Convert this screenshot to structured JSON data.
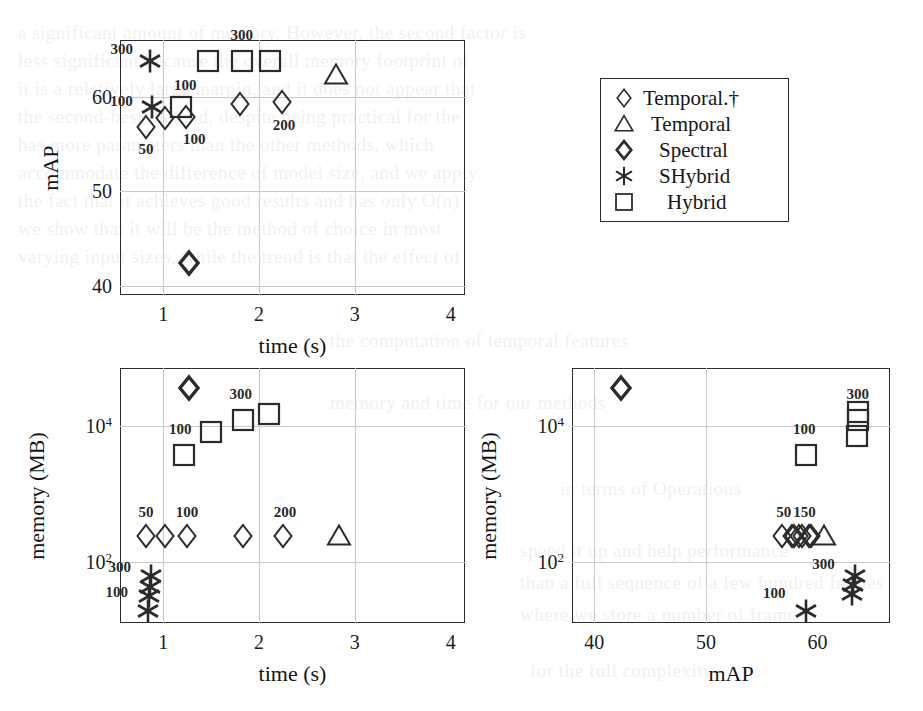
{
  "figure": {
    "background_color": "#ffffff",
    "marker_color": "#2b2b2b",
    "grid_color": "#c9c9c9",
    "axis_color": "#2b2b2b"
  },
  "legend": {
    "position": "top-right",
    "entries": [
      {
        "label": "Temporal.†",
        "marker": "diamond-thin"
      },
      {
        "label": "Temporal",
        "marker": "triangle"
      },
      {
        "label": "Spectral",
        "marker": "diamond-bold"
      },
      {
        "label": "SHybrid",
        "marker": "star"
      },
      {
        "label": "Hybrid",
        "marker": "square"
      }
    ]
  },
  "bleed_text": [
    {
      "text": "a significant amount of memory.  However, the second factor is",
      "x": 18,
      "y": 22,
      "size": 19
    },
    {
      "text": "less significant because the overall memory footprint of",
      "x": 18,
      "y": 50,
      "size": 19
    },
    {
      "text": "it is a relatively large margin, and it does not appear that",
      "x": 18,
      "y": 78,
      "size": 19
    },
    {
      "text": "the second-best method, despite being practical for the",
      "x": 18,
      "y": 106,
      "size": 19
    },
    {
      "text": "has more parameters than the other methods, which",
      "x": 18,
      "y": 134,
      "size": 19
    },
    {
      "text": "accommodate the difference of model size, and we apply",
      "x": 18,
      "y": 162,
      "size": 19
    },
    {
      "text": "the fact that it achieves good results and has only O(n)",
      "x": 18,
      "y": 190,
      "size": 19
    },
    {
      "text": "we show that it will be the method of choice in most",
      "x": 18,
      "y": 218,
      "size": 19
    },
    {
      "text": "varying input sizes, while the trend is that the effect of",
      "x": 18,
      "y": 246,
      "size": 19
    },
    {
      "text": "the computation of temporal features",
      "x": 330,
      "y": 330,
      "size": 19
    },
    {
      "text": "memory and time for our methods",
      "x": 330,
      "y": 392,
      "size": 19
    },
    {
      "text": "in terms of Operations",
      "x": 560,
      "y": 478,
      "size": 19
    },
    {
      "text": "speed it up and help performance",
      "x": 520,
      "y": 540,
      "size": 19
    },
    {
      "text": "than a full sequence of a few hundred frames",
      "x": 520,
      "y": 572,
      "size": 19
    },
    {
      "text": "where we store a number of frames",
      "x": 520,
      "y": 604,
      "size": 19
    },
    {
      "text": "for the full complexity",
      "x": 530,
      "y": 660,
      "size": 19
    }
  ],
  "chart_data": [
    {
      "id": "map-vs-time",
      "type": "scatter",
      "title": "",
      "xlabel": "time (s)",
      "ylabel": "mAP",
      "xlim": [
        0.55,
        4.15
      ],
      "ylim": [
        39.0,
        66.0
      ],
      "xticks": [
        "1",
        "2",
        "3",
        "4"
      ],
      "xtick_values": [
        1,
        2,
        3,
        4
      ],
      "yticks": [
        "60",
        "50",
        "40"
      ],
      "ytick_values": [
        60,
        50,
        40
      ],
      "grid": true,
      "series": [
        {
          "name": "Temporal.†",
          "marker": "diamond-thin",
          "points": [
            {
              "x": 0.82,
              "y": 56.8,
              "label": "50",
              "label_dx": 0,
              "label_dy": 22
            },
            {
              "x": 1.02,
              "y": 57.7,
              "label": null,
              "label_dx": 0,
              "label_dy": 0
            },
            {
              "x": 1.24,
              "y": 57.9,
              "label": "100",
              "label_dx": 8,
              "label_dy": 22
            },
            {
              "x": 1.8,
              "y": 59.2,
              "label": null,
              "label_dx": 0,
              "label_dy": 0
            },
            {
              "x": 2.24,
              "y": 59.4,
              "label": "200",
              "label_dx": 2,
              "label_dy": 23
            }
          ]
        },
        {
          "name": "Temporal",
          "marker": "triangle",
          "points": [
            {
              "x": 2.8,
              "y": 62.3,
              "label": null,
              "label_dx": 0,
              "label_dy": 0
            }
          ]
        },
        {
          "name": "Spectral",
          "marker": "diamond-bold",
          "points": [
            {
              "x": 1.27,
              "y": 42.4,
              "label": null,
              "label_dx": 0,
              "label_dy": 0
            }
          ]
        },
        {
          "name": "SHybrid",
          "marker": "star",
          "points": [
            {
              "x": 0.86,
              "y": 63.8,
              "label": "300",
              "label_dx": -28,
              "label_dy": -12
            },
            {
              "x": 0.88,
              "y": 58.9,
              "label": "100",
              "label_dx": -30,
              "label_dy": -6
            }
          ]
        },
        {
          "name": "Hybrid",
          "marker": "square",
          "points": [
            {
              "x": 1.19,
              "y": 58.9,
              "label": "100",
              "label_dx": 4,
              "label_dy": -22
            },
            {
              "x": 1.47,
              "y": 63.8,
              "label": null,
              "label_dx": 0,
              "label_dy": 0
            },
            {
              "x": 1.82,
              "y": 63.8,
              "label": "300",
              "label_dx": 0,
              "label_dy": -26
            },
            {
              "x": 2.12,
              "y": 63.8,
              "label": null,
              "label_dx": 0,
              "label_dy": 0
            }
          ]
        }
      ]
    },
    {
      "id": "memory-vs-time",
      "type": "scatter",
      "title": "",
      "xlabel": "time (s)",
      "ylabel": "memory (MB)",
      "xlim": [
        0.55,
        4.15
      ],
      "ylim_log10": [
        1.1,
        4.85
      ],
      "xticks": [
        "1",
        "2",
        "3",
        "4"
      ],
      "xtick_values": [
        1,
        2,
        3,
        4
      ],
      "yticks": [
        "10⁴",
        "10²"
      ],
      "ytick_values": [
        10000,
        100
      ],
      "grid": true,
      "yscale": "log",
      "series": [
        {
          "name": "Temporal.†",
          "marker": "diamond-thin",
          "points": [
            {
              "x": 0.82,
              "y": 240,
              "label": "50",
              "label_dx": 0,
              "label_dy": -24
            },
            {
              "x": 1.02,
              "y": 240,
              "label": null,
              "label_dx": 0,
              "label_dy": 0
            },
            {
              "x": 1.25,
              "y": 240,
              "label": "100",
              "label_dx": 0,
              "label_dy": -24
            },
            {
              "x": 1.83,
              "y": 240,
              "label": null,
              "label_dx": 0,
              "label_dy": 0
            },
            {
              "x": 2.25,
              "y": 240,
              "label": "200",
              "label_dx": 2,
              "label_dy": -24
            }
          ]
        },
        {
          "name": "Temporal",
          "marker": "triangle",
          "points": [
            {
              "x": 2.83,
              "y": 240,
              "label": null,
              "label_dx": 0,
              "label_dy": 0
            }
          ]
        },
        {
          "name": "Spectral",
          "marker": "diamond-bold",
          "points": [
            {
              "x": 1.27,
              "y": 36000,
              "label": null,
              "label_dx": 0,
              "label_dy": 0
            }
          ]
        },
        {
          "name": "SHybrid",
          "marker": "star",
          "points": [
            {
              "x": 0.87,
              "y": 62,
              "label": "300",
              "label_dx": -31,
              "label_dy": -9
            },
            {
              "x": 0.86,
              "y": 42,
              "label": null,
              "label_dx": 0,
              "label_dy": 0
            },
            {
              "x": 0.85,
              "y": 31,
              "label": "100",
              "label_dx": -32,
              "label_dy": -4
            },
            {
              "x": 0.84,
              "y": 19,
              "label": null,
              "label_dx": 0,
              "label_dy": 0
            }
          ]
        },
        {
          "name": "Hybrid",
          "marker": "square",
          "points": [
            {
              "x": 1.22,
              "y": 3700,
              "label": "100",
              "label_dx": -4,
              "label_dy": -26
            },
            {
              "x": 1.5,
              "y": 8000,
              "label": null,
              "label_dx": 0,
              "label_dy": 0
            },
            {
              "x": 1.83,
              "y": 12000,
              "label": "300",
              "label_dx": -2,
              "label_dy": -26
            },
            {
              "x": 2.1,
              "y": 15000,
              "label": null,
              "label_dx": 0,
              "label_dy": 0
            }
          ]
        }
      ]
    },
    {
      "id": "memory-vs-map",
      "type": "scatter",
      "title": "",
      "xlabel": "mAP",
      "ylabel": "memory (MB)",
      "xlim": [
        38.0,
        66.5
      ],
      "ylim_log10": [
        1.1,
        4.85
      ],
      "xticks": [
        "40",
        "50",
        "60"
      ],
      "xtick_values": [
        40,
        50,
        60
      ],
      "yticks": [
        "10⁴",
        "10²"
      ],
      "ytick_values": [
        10000,
        100
      ],
      "grid": true,
      "yscale": "log",
      "series": [
        {
          "name": "Temporal.†",
          "marker": "diamond-thin",
          "points": [
            {
              "x": 56.8,
              "y": 240,
              "label": "50",
              "label_dx": 2,
              "label_dy": -24
            },
            {
              "x": 57.7,
              "y": 240,
              "label": null,
              "label_dx": 0,
              "label_dy": 0
            },
            {
              "x": 57.9,
              "y": 240,
              "label": null,
              "label_dx": 0,
              "label_dy": 0
            },
            {
              "x": 58.3,
              "y": 240,
              "label": "150",
              "label_dx": 6,
              "label_dy": -24
            },
            {
              "x": 58.6,
              "y": 240,
              "label": null,
              "label_dx": 0,
              "label_dy": 0
            },
            {
              "x": 59.2,
              "y": 240,
              "label": null,
              "label_dx": 0,
              "label_dy": 0
            },
            {
              "x": 59.4,
              "y": 240,
              "label": null,
              "label_dx": 0,
              "label_dy": 0
            }
          ]
        },
        {
          "name": "Temporal",
          "marker": "triangle",
          "points": [
            {
              "x": 60.6,
              "y": 240,
              "label": null,
              "label_dx": 0,
              "label_dy": 0
            }
          ]
        },
        {
          "name": "Spectral",
          "marker": "diamond-bold",
          "points": [
            {
              "x": 42.4,
              "y": 36000,
              "label": null,
              "label_dx": 0,
              "label_dy": 0
            }
          ]
        },
        {
          "name": "SHybrid",
          "marker": "star",
          "points": [
            {
              "x": 63.4,
              "y": 62,
              "label": "300",
              "label_dx": -32,
              "label_dy": -12
            },
            {
              "x": 63.2,
              "y": 46,
              "label": null,
              "label_dx": 0,
              "label_dy": 0
            },
            {
              "x": 63.1,
              "y": 34,
              "label": null,
              "label_dx": 0,
              "label_dy": 0
            },
            {
              "x": 59.0,
              "y": 19,
              "label": "100",
              "label_dx": -32,
              "label_dy": -18
            }
          ]
        },
        {
          "name": "Hybrid",
          "marker": "square",
          "points": [
            {
              "x": 59.0,
              "y": 3700,
              "label": "100",
              "label_dx": -2,
              "label_dy": -26
            },
            {
              "x": 63.5,
              "y": 7000,
              "label": null,
              "label_dx": 0,
              "label_dy": 0
            },
            {
              "x": 63.6,
              "y": 12000,
              "label": "300",
              "label_dx": 0,
              "label_dy": -26
            },
            {
              "x": 63.6,
              "y": 16000,
              "label": null,
              "label_dx": 0,
              "label_dy": 0
            }
          ]
        }
      ]
    }
  ]
}
